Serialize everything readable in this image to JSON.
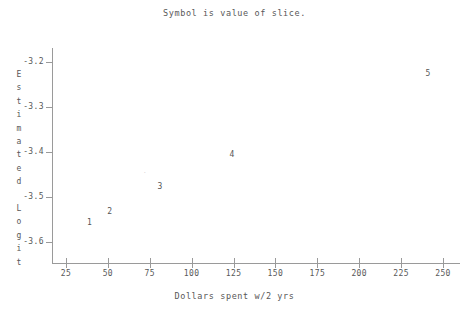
{
  "chart_data": {
    "type": "scatter",
    "title": "Symbol is value of slice.",
    "xlabel": "Dollars spent w/2 yrs",
    "ylabel": "Estimated Logit",
    "ylabel_lines": [
      "Estimated",
      "",
      "Logit"
    ],
    "xlim": [
      20,
      263
    ],
    "ylim": [
      -3.638,
      -3.158
    ],
    "grid": false,
    "legend": null,
    "xticks": [
      25,
      50,
      75,
      100,
      125,
      150,
      175,
      200,
      225,
      250
    ],
    "xtick_labels": [
      "25",
      "50",
      "75",
      "100",
      "125",
      "150",
      "175",
      "200",
      "225",
      "250"
    ],
    "yticks": [
      -3.2,
      -3.3,
      -3.4,
      -3.5,
      -3.6
    ],
    "ytick_labels": [
      "-3.2",
      "-3.3",
      "-3.4",
      "-3.5",
      "-3.6"
    ],
    "point_label_note": "Each plotted marker is the text digit of the slice value",
    "points": [
      {
        "label": "1",
        "x": 39,
        "y": -3.557,
        "faint": false
      },
      {
        "label": "2",
        "x": 51,
        "y": -3.533,
        "faint": false
      },
      {
        "label": "3",
        "x": 81,
        "y": -3.478,
        "faint": false
      },
      {
        "label": "4",
        "x": 124,
        "y": -3.407,
        "faint": false
      },
      {
        "label": "5",
        "x": 241,
        "y": -3.227,
        "faint": false
      },
      {
        "label": ".",
        "x": 72,
        "y": -3.444,
        "faint": true
      }
    ]
  },
  "figure": {
    "title": "Symbol is value of slice.",
    "xlabel": "Dollars spent w/2 yrs"
  }
}
